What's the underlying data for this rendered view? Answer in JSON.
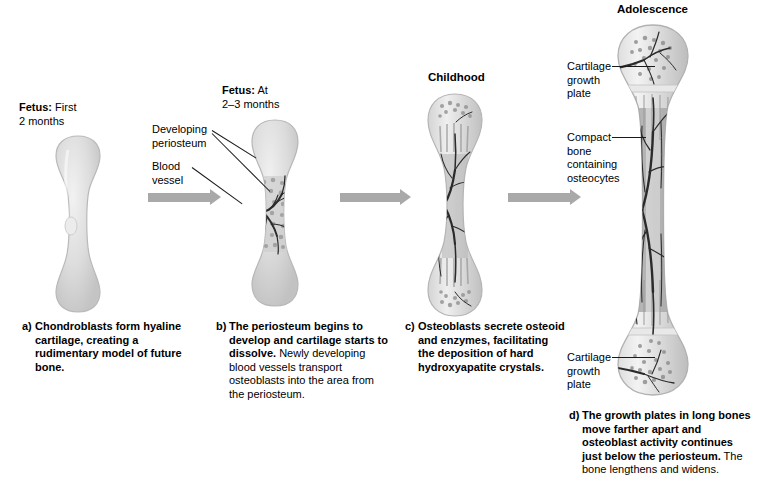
{
  "figure": {
    "background_color": "#ffffff",
    "arrow_color": "#a9a9a9",
    "leader_color": "#1a1a1a"
  },
  "stage_headings": {
    "stage1_bold": "Fetus:",
    "stage1_rest": " First\n2 months",
    "stage2_bold": "Fetus:",
    "stage2_rest": " At\n2–3 months",
    "stage3": "Childhood",
    "stage4": "Adolescence"
  },
  "callouts": {
    "developing_periosteum": "Developing\nperiosteum",
    "blood_vessel": "Blood\nvessel",
    "cartilage_growth_plate_top": "Cartilage\ngrowth\nplate",
    "compact_bone": "Compact\nbone\ncontaining\nosteocytes",
    "cartilage_growth_plate_bottom": "Cartilage\ngrowth\nplate"
  },
  "captions": [
    {
      "index": "a)",
      "bold": "Chondroblasts form hyaline cartilage, creating a rudimentary model of future bone.",
      "rest": ""
    },
    {
      "index": "b)",
      "bold": "The periosteum begins to develop and cartilage starts to dissolve.",
      "rest": " Newly developing blood vessels transport osteoblasts into the area from the periosteum."
    },
    {
      "index": "c)",
      "bold": "Osteoblasts secrete osteoid and enzymes, facilitating the deposition of hard hydroxyapatite crystals.",
      "rest": ""
    },
    {
      "index": "d)",
      "bold": "The growth plates in long bones move farther apart and osteoblast activity continues just below the periosteum.",
      "rest": " The bone lengthens and widens."
    }
  ],
  "colors": {
    "cartilage_fill": "#dcdcdc",
    "cartilage_edge": "#b8b8b8",
    "bone_fill": "#c9c9c9",
    "vessel": "#2b2b2b",
    "marrow": "#a6a6a6"
  }
}
